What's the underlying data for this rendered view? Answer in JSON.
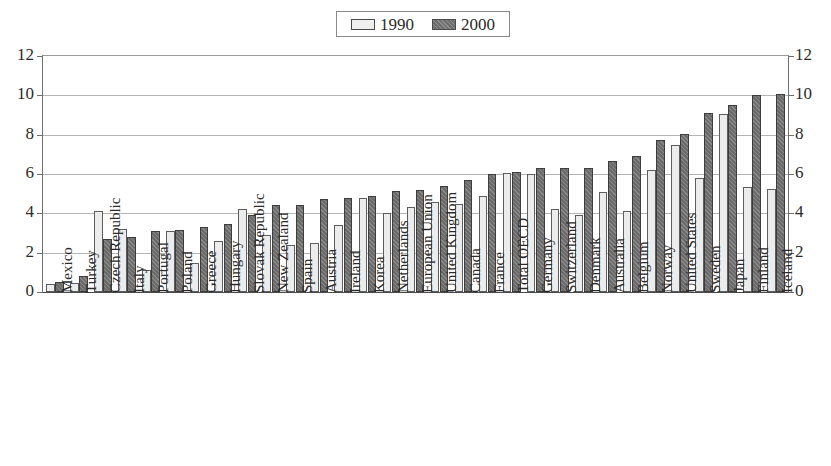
{
  "legend": {
    "entries": [
      {
        "label": "1990",
        "swatch": "light-swatch-icon",
        "color": "#efefef"
      },
      {
        "label": "2000",
        "swatch": "dark-hatched-swatch-icon",
        "color": "#6e6e6e"
      }
    ]
  },
  "axis": {
    "y_ticks": [
      "0",
      "2",
      "4",
      "6",
      "8",
      "10",
      "12"
    ],
    "y_ticks_right": [
      "0",
      "2",
      "4",
      "6",
      "8",
      "10",
      "12"
    ]
  },
  "chart_data": {
    "type": "bar",
    "title": "",
    "xlabel": "",
    "ylabel": "",
    "ylim": [
      0,
      12
    ],
    "ytick_step": 2,
    "grid": true,
    "legend_position": "top-center",
    "categories": [
      "Mexico",
      "Turkey",
      "Czech Republic",
      "Italy",
      "Portugal",
      "Poland",
      "Greece",
      "Hungary",
      "Slovak Republic",
      "New Zealand",
      "Spain",
      "Austria",
      "Ireland",
      "Korea",
      "Netherlands",
      "European Union",
      "United Kingdom",
      "Canada",
      "France",
      "Total OECD",
      "Germany",
      "Switzerland",
      "Denmark",
      "Australia",
      "Belgium",
      "Norway",
      "United States",
      "Sweden",
      "Japan",
      "Finland",
      "Iceland"
    ],
    "series": [
      {
        "name": "1990",
        "color": "#efefef",
        "values": [
          0.4,
          0.45,
          4.1,
          3.2,
          1.1,
          3.1,
          1.5,
          2.6,
          4.2,
          2.9,
          2.4,
          2.5,
          3.4,
          4.8,
          4.0,
          4.3,
          4.6,
          4.5,
          4.9,
          6.05,
          6.0,
          4.2,
          3.9,
          5.1,
          4.1,
          6.2,
          7.5,
          5.8,
          9.05,
          5.35,
          5.25
        ]
      },
      {
        "name": "2000",
        "color": "#6b6b6b",
        "values": [
          0.5,
          0.8,
          2.7,
          2.8,
          3.1,
          3.15,
          3.3,
          3.45,
          3.9,
          4.4,
          4.4,
          4.75,
          4.8,
          4.9,
          5.15,
          5.2,
          5.4,
          5.7,
          6.0,
          6.1,
          6.3,
          6.3,
          6.3,
          6.65,
          6.9,
          7.75,
          8.05,
          9.1,
          9.5,
          10.0,
          10.05
        ]
      }
    ]
  }
}
